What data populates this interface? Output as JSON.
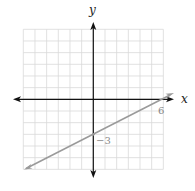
{
  "chart_data": {
    "type": "line",
    "title": "",
    "xlabel": "x",
    "ylabel": "y",
    "xlim": [
      -6,
      6
    ],
    "ylim": [
      -6,
      6
    ],
    "grid": true,
    "grid_step": 1,
    "series": [
      {
        "name": "line",
        "equation": "y = 0.5x - 3",
        "x": [
          -6,
          0,
          6,
          7
        ],
        "y": [
          -6,
          -3,
          0,
          0.5
        ],
        "color": "#9a9a9a"
      }
    ],
    "annotations": [
      {
        "text": "-3",
        "x": 0,
        "y": -3,
        "note": "y-intercept"
      },
      {
        "text": "6",
        "x": 6,
        "y": 0,
        "note": "x-intercept"
      }
    ]
  },
  "labels": {
    "x_axis": "x",
    "y_axis": "y",
    "y_intercept": "−3",
    "x_intercept": "6"
  },
  "colors": {
    "grid": "#d9d9d9",
    "axis": "#111111",
    "line": "#9a9a9a"
  }
}
